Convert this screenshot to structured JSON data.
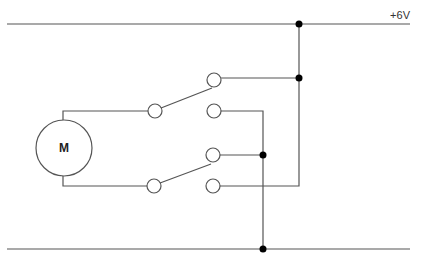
{
  "diagram": {
    "type": "circuit-schematic",
    "supply_label": "+6V",
    "motor_label": "M",
    "components": [
      {
        "name": "motor",
        "label": "M"
      },
      {
        "name": "dpdt-switch",
        "poles": 2,
        "throws": 2
      }
    ],
    "rails": [
      {
        "name": "positive-rail",
        "label": "+6V"
      },
      {
        "name": "ground-rail",
        "label": ""
      }
    ]
  }
}
